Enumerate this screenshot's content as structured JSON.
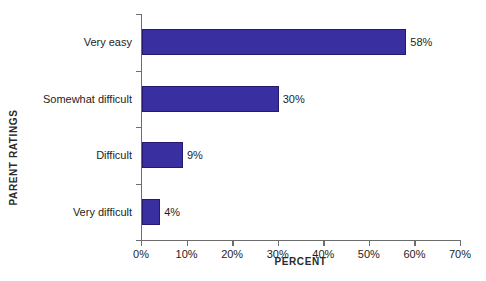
{
  "chart_data": {
    "type": "bar",
    "orientation": "horizontal",
    "title": "",
    "xlabel": "PERCENT",
    "ylabel": "PARENT RATINGS",
    "categories": [
      "Very easy",
      "Somewhat difficult",
      "Difficult",
      "Very difficult"
    ],
    "values": [
      58,
      30,
      9,
      4
    ],
    "value_labels": [
      "58%",
      "30%",
      "9%",
      "4%"
    ],
    "xlim": [
      0,
      70
    ],
    "xticks": [
      0,
      10,
      20,
      30,
      40,
      50,
      60,
      70
    ],
    "xtick_labels": [
      "0%",
      "10%",
      "20%",
      "30%",
      "40%",
      "50%",
      "60%",
      "70%"
    ],
    "grid": false,
    "legend": null,
    "bar_color": "#3a2fa0",
    "bar_border_color": "#23196e",
    "axis_color": "#6d6d6d",
    "background": "#ffffff"
  }
}
